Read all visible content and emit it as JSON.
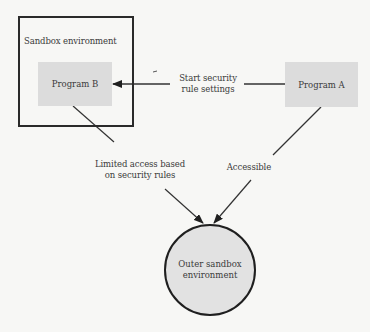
{
  "diagram": {
    "nodes": {
      "sandbox": {
        "label": "Sandbox environment"
      },
      "program_b": {
        "label": "Program B"
      },
      "program_a": {
        "label": "Program A"
      },
      "outer": {
        "line1": "Outer sandbox",
        "line2": "environment"
      }
    },
    "edges": {
      "start_rules": {
        "line1": "Start security",
        "line2": "rule settings"
      },
      "limited": {
        "line1": "Limited access based",
        "line2": "on security rules"
      },
      "accessible": {
        "label": "Accessible"
      }
    },
    "colors": {
      "background": "#f7f7f5",
      "box_fill": "#dcdcdc",
      "circle_fill": "#e2e2e2",
      "stroke": "#2a2a2a"
    }
  }
}
